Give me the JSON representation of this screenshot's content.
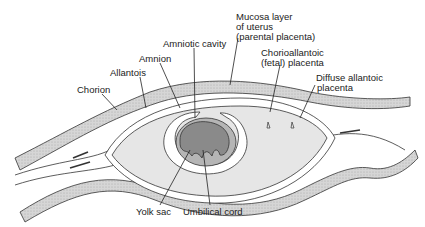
{
  "diagram": {
    "labels": {
      "mucosa_line1": "Mucosa layer",
      "mucosa_line2": "of uterus",
      "mucosa_line3": "(parental placenta)",
      "amniotic_cavity": "Amniotic cavity",
      "amnion": "Amnion",
      "allantois": "Allantois",
      "chorion": "Chorion",
      "chorioallantoic_line1": "Chorioallantoic",
      "chorioallantoic_line2": "(fetal) placenta",
      "diffuse_line1": "Diffuse allantoic",
      "diffuse_line2": "placenta",
      "yolk_sac": "Yolk sac",
      "umbilical_cord": "Umbilical cord"
    },
    "colors": {
      "mucosa_fill": "#cfcfcf",
      "allantois_fill": "#e6e6e6",
      "embryo_fill": "#8a8a8a",
      "amnion_fill": "#b5b5b5",
      "outline": "#333333"
    }
  }
}
